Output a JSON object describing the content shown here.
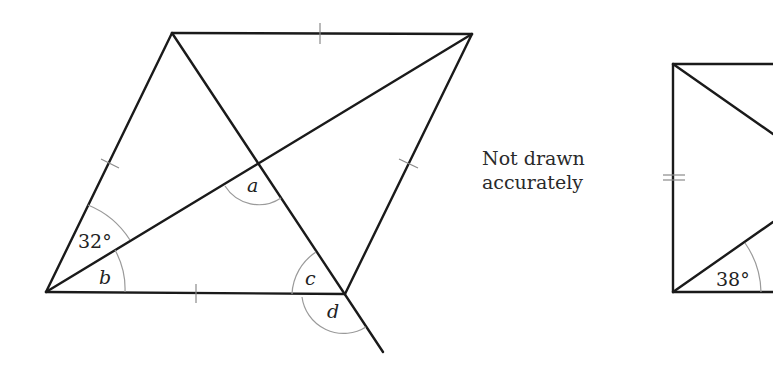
{
  "note": {
    "line1": "Not drawn",
    "line2": "accurately"
  },
  "figure_left": {
    "type": "rhombus with diagonals",
    "angle_given": "32°",
    "angle_labels": [
      "a",
      "b",
      "c",
      "d"
    ]
  },
  "figure_right": {
    "type": "partial quadrilateral with diagonals",
    "angle_given": "38°"
  },
  "colors": {
    "line": "#1a1a1a",
    "mark": "#8a8a8a",
    "background": "#ffffff"
  }
}
